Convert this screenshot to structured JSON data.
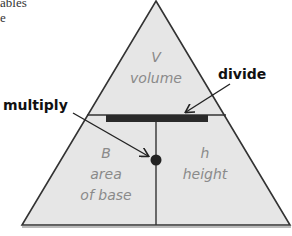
{
  "fragment": {
    "line1": "ables",
    "line2": "e"
  },
  "triangle": {
    "top_section": {
      "symbol": "V",
      "name": "volume"
    },
    "bottom_left": {
      "symbol": "B",
      "name_line1": "area",
      "name_line2": "of base"
    },
    "bottom_right": {
      "symbol": "h",
      "name": "height"
    }
  },
  "callouts": {
    "divide": "divide",
    "multiply": "multiply"
  },
  "colors": {
    "fill": "#e6e6e6",
    "stroke": "#333333",
    "bar": "#2a2a2a",
    "label": "#8a8a8a",
    "callout": "#111111"
  }
}
